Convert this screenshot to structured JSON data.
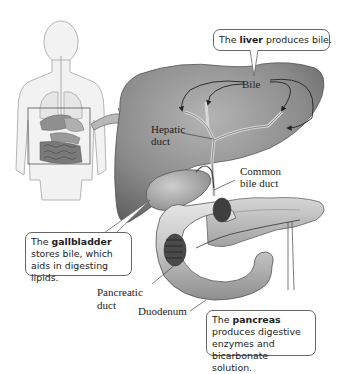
{
  "figure": {
    "type": "anatomical-diagram",
    "colors": {
      "organ_fill": "#8a8a8a",
      "organ_dark": "#5f5f5f",
      "organ_light": "#c8c8c8",
      "body_outline": "#9a9a9a",
      "callout_border": "#666666",
      "background": "#ffffff"
    }
  },
  "labels": {
    "bile": "Bile",
    "hepatic_duct_line1": "Hepatic",
    "hepatic_duct_line2": "duct",
    "common_bile_duct_line1": "Common",
    "common_bile_duct_line2": "bile duct",
    "pancreatic_duct_line1": "Pancreatic",
    "pancreatic_duct_line2": "duct",
    "duodenum": "Duodenum"
  },
  "callouts": {
    "liver": {
      "prefix": "The ",
      "bold": "liver",
      "suffix": " produces bile."
    },
    "gallbladder": {
      "prefix": "The ",
      "bold": "gallbladder",
      "suffix": " stores bile, which aids in digesting lipids."
    },
    "pancreas": {
      "prefix": "The ",
      "bold": "pancreas",
      "suffix": " produces digestive enzymes and bicarbonate solution."
    }
  }
}
